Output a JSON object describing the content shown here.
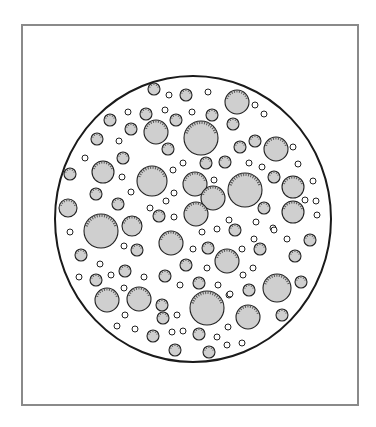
{
  "figure": {
    "frame_color": "#8a8a8a",
    "field": {
      "cx": 193,
      "cy": 219,
      "rx": 138,
      "ry": 143,
      "stroke": "#1a1a1a"
    },
    "particle_fill": "#cfcfcf",
    "particle_stroke": "#222222",
    "large": [
      [
        201,
        138,
        17
      ],
      [
        156,
        132,
        12
      ],
      [
        237,
        102,
        12
      ],
      [
        276,
        149,
        12
      ],
      [
        152,
        181,
        15
      ],
      [
        245,
        190,
        17
      ],
      [
        101,
        231,
        17
      ],
      [
        207,
        308,
        17
      ],
      [
        277,
        288,
        14
      ],
      [
        107,
        300,
        12
      ],
      [
        139,
        299,
        12
      ],
      [
        248,
        317,
        12
      ],
      [
        171,
        243,
        12
      ],
      [
        227,
        261,
        12
      ],
      [
        195,
        184,
        12
      ],
      [
        213,
        198,
        12
      ],
      [
        196,
        214,
        12
      ],
      [
        293,
        187,
        11
      ],
      [
        293,
        212,
        11
      ],
      [
        103,
        172,
        11
      ],
      [
        132,
        226,
        10
      ],
      [
        68,
        208,
        9
      ]
    ],
    "medium": [
      [
        154,
        89,
        6
      ],
      [
        186,
        95,
        6
      ],
      [
        110,
        120,
        6
      ],
      [
        146,
        114,
        6
      ],
      [
        176,
        120,
        6
      ],
      [
        212,
        115,
        6
      ],
      [
        233,
        124,
        6
      ],
      [
        97,
        139,
        6
      ],
      [
        131,
        129,
        6
      ],
      [
        168,
        149,
        6
      ],
      [
        123,
        158,
        6
      ],
      [
        240,
        147,
        6
      ],
      [
        255,
        141,
        6
      ],
      [
        225,
        162,
        6
      ],
      [
        70,
        174,
        6
      ],
      [
        206,
        163,
        6
      ],
      [
        96,
        194,
        6
      ],
      [
        118,
        204,
        6
      ],
      [
        274,
        177,
        6
      ],
      [
        264,
        208,
        6
      ],
      [
        159,
        216,
        6
      ],
      [
        235,
        230,
        6
      ],
      [
        81,
        255,
        6
      ],
      [
        137,
        250,
        6
      ],
      [
        208,
        248,
        6
      ],
      [
        260,
        249,
        6
      ],
      [
        310,
        240,
        6
      ],
      [
        186,
        265,
        6
      ],
      [
        295,
        256,
        6
      ],
      [
        125,
        271,
        6
      ],
      [
        165,
        276,
        6
      ],
      [
        96,
        280,
        6
      ],
      [
        199,
        283,
        6
      ],
      [
        249,
        290,
        6
      ],
      [
        301,
        282,
        6
      ],
      [
        162,
        305,
        6
      ],
      [
        163,
        318,
        6
      ],
      [
        282,
        315,
        6
      ],
      [
        153,
        336,
        6
      ],
      [
        199,
        334,
        6
      ],
      [
        175,
        350,
        6
      ],
      [
        209,
        352,
        6
      ]
    ],
    "small": [
      [
        169,
        95,
        3
      ],
      [
        208,
        92,
        3
      ],
      [
        128,
        112,
        3
      ],
      [
        165,
        110,
        3
      ],
      [
        192,
        112,
        3
      ],
      [
        255,
        105,
        3
      ],
      [
        264,
        114,
        3
      ],
      [
        119,
        141,
        3
      ],
      [
        293,
        147,
        3
      ],
      [
        85,
        158,
        3
      ],
      [
        183,
        163,
        3
      ],
      [
        249,
        163,
        3
      ],
      [
        262,
        167,
        3
      ],
      [
        298,
        164,
        3
      ],
      [
        173,
        170,
        3
      ],
      [
        214,
        180,
        3
      ],
      [
        122,
        177,
        3
      ],
      [
        313,
        181,
        3
      ],
      [
        131,
        192,
        3
      ],
      [
        174,
        193,
        3
      ],
      [
        166,
        201,
        3
      ],
      [
        150,
        208,
        3
      ],
      [
        305,
        200,
        3
      ],
      [
        316,
        201,
        3
      ],
      [
        317,
        215,
        3
      ],
      [
        174,
        217,
        3
      ],
      [
        229,
        220,
        3
      ],
      [
        256,
        222,
        3
      ],
      [
        217,
        229,
        3
      ],
      [
        70,
        232,
        3
      ],
      [
        202,
        232,
        3
      ],
      [
        273,
        228,
        3
      ],
      [
        287,
        239,
        3
      ],
      [
        274,
        230,
        3
      ],
      [
        124,
        246,
        3
      ],
      [
        254,
        239,
        3
      ],
      [
        193,
        249,
        3
      ],
      [
        242,
        249,
        3
      ],
      [
        100,
        264,
        3
      ],
      [
        111,
        275,
        3
      ],
      [
        207,
        268,
        3
      ],
      [
        243,
        275,
        3
      ],
      [
        144,
        277,
        3
      ],
      [
        79,
        277,
        3
      ],
      [
        218,
        285,
        3
      ],
      [
        180,
        285,
        3
      ],
      [
        253,
        268,
        3
      ],
      [
        229,
        295,
        3
      ],
      [
        124,
        288,
        3
      ],
      [
        230,
        294,
        3
      ],
      [
        177,
        315,
        3
      ],
      [
        125,
        315,
        3
      ],
      [
        117,
        326,
        3
      ],
      [
        135,
        329,
        3
      ],
      [
        172,
        332,
        3
      ],
      [
        183,
        331,
        3
      ],
      [
        217,
        337,
        3
      ],
      [
        228,
        327,
        3
      ],
      [
        227,
        345,
        3
      ],
      [
        242,
        343,
        3
      ]
    ]
  }
}
